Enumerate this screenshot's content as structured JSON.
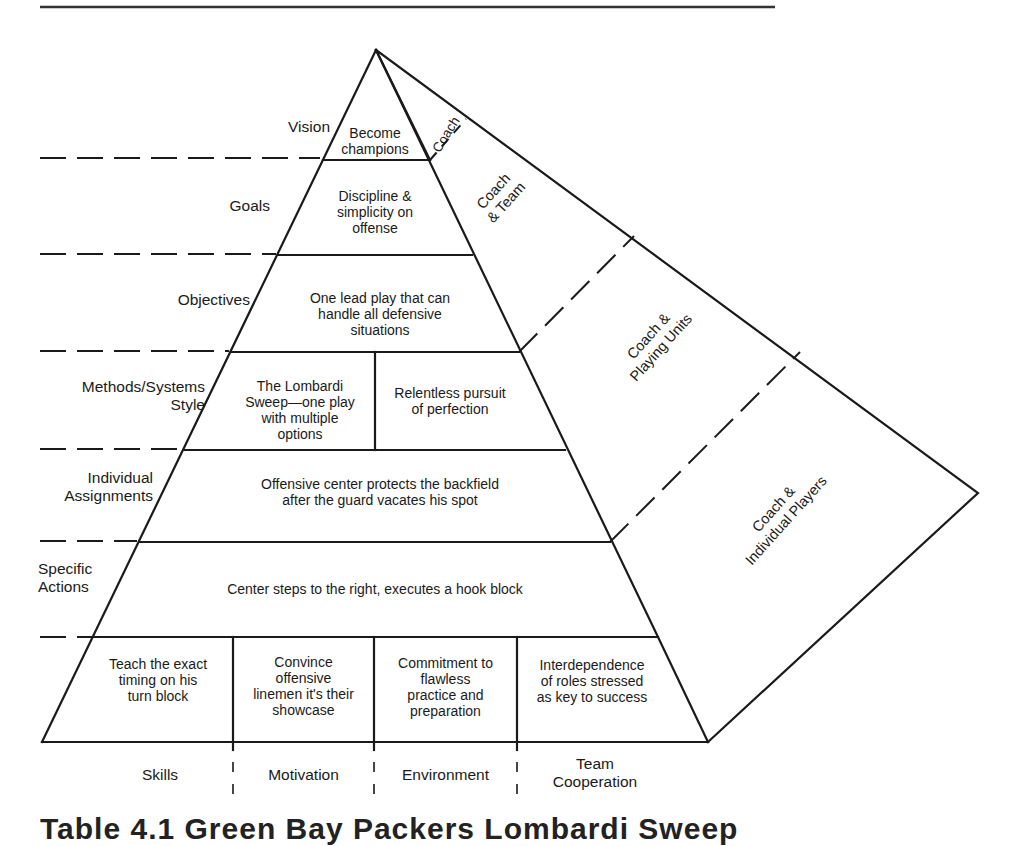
{
  "diagram": {
    "type": "layered-pyramid",
    "levels": [
      {
        "label": "Vision",
        "content": [
          "Become",
          "champions"
        ]
      },
      {
        "label": "Goals",
        "content": [
          "Discipline &",
          "simplicity on",
          "offense"
        ]
      },
      {
        "label": "Objectives",
        "content": [
          "One lead play that can",
          "handle all defensive",
          "situations"
        ]
      },
      {
        "label_lines": [
          "Methods/Systems",
          "Style"
        ],
        "cells": [
          {
            "content": [
              "The Lombardi",
              "Sweep—one play",
              "with multiple",
              "options"
            ]
          },
          {
            "content": [
              "Relentless pursuit",
              "of perfection"
            ]
          }
        ]
      },
      {
        "label_lines": [
          "Individual",
          "Assignments"
        ],
        "content": [
          "Offensive center protects the backfield",
          "after the guard vacates his spot"
        ]
      },
      {
        "label_lines": [
          "Specific",
          "Actions"
        ],
        "content": [
          "Center steps to the right, executes a hook block"
        ]
      },
      {
        "cells": [
          {
            "content": [
              "Teach the exact",
              "timing on his",
              "turn block"
            ]
          },
          {
            "content": [
              "Convince",
              "offensive",
              "linemen it's their",
              "showcase"
            ]
          },
          {
            "content": [
              "Commitment to",
              "flawless",
              "practice and",
              "preparation"
            ]
          },
          {
            "content": [
              "Interdependence",
              "of roles stressed",
              "as key to success"
            ]
          }
        ]
      }
    ],
    "side_face": [
      {
        "lines": [
          "Coach"
        ]
      },
      {
        "lines": [
          "Coach",
          "& Team"
        ]
      },
      {
        "lines": [
          "Coach &",
          "Playing Units"
        ]
      },
      {
        "lines": [
          "Coach &",
          "Individual Players"
        ]
      }
    ],
    "base_columns": [
      {
        "lines": [
          "Skills"
        ]
      },
      {
        "lines": [
          "Motivation"
        ]
      },
      {
        "lines": [
          "Environment"
        ]
      },
      {
        "lines": [
          "Team",
          "Cooperation"
        ]
      }
    ],
    "cut_off_title": "Table 4.1  Green Bay Packers Lombardi Sweep"
  }
}
